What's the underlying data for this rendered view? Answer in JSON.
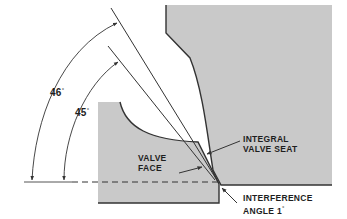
{
  "diagram": {
    "colors": {
      "metal_fill": "#c9c9c9",
      "outline": "#333333",
      "background": "#ffffff",
      "text": "#1e1e1e"
    },
    "angles": {
      "outer": {
        "value": "46",
        "unit": "°"
      },
      "inner": {
        "value": "45",
        "unit": "°"
      }
    },
    "labels": {
      "valve_face": [
        "VALVE",
        "FACE"
      ],
      "integral_valve_seat": [
        "INTEGRAL",
        "VALVE SEAT"
      ],
      "interference_angle": [
        "INTERFERENCE",
        "ANGLE 1"
      ],
      "interference_angle_unit": "°"
    }
  }
}
